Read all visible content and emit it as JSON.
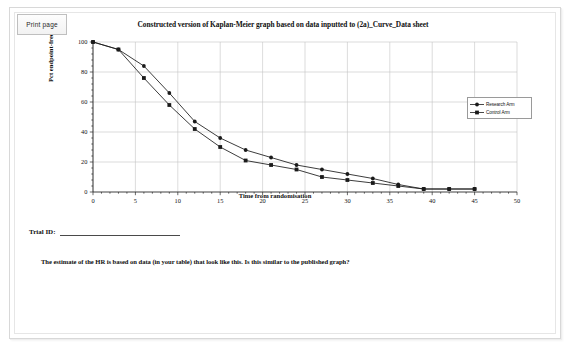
{
  "toolbar": {
    "print_page_label": "Print page"
  },
  "chart": {
    "title": "Constructed version of Kaplan-Meier graph based on data inputted to (2a)_Curve_Data sheet",
    "legend": {
      "position": "right",
      "entries": [
        {
          "label": "Research Arm",
          "color": "#1a1a1a",
          "marker": "square"
        },
        {
          "label": "Control Arm",
          "color": "#1a1a1a",
          "marker": "square"
        }
      ]
    }
  },
  "form": {
    "trial_id_label": "Trial ID:",
    "trial_id_value": ""
  },
  "instructions": {
    "hr_question": "The estimate of the HR is based on data (in your table) that look like this.  Is this similar to the published graph?"
  },
  "chart_data": {
    "type": "line",
    "title": "Constructed version of Kaplan-Meier graph based on data inputted to (2a)_Curve_Data sheet",
    "xlabel": "Time from randomisation",
    "ylabel": "Pct endpoint-free",
    "xlim": [
      0,
      50
    ],
    "ylim": [
      0,
      100
    ],
    "xticks": [
      0,
      5,
      10,
      15,
      20,
      25,
      30,
      35,
      40,
      45,
      50
    ],
    "yticks": [
      0,
      20,
      40,
      60,
      80,
      100
    ],
    "grid": true,
    "x": [
      0,
      3,
      6,
      9,
      12,
      15,
      18,
      21,
      24,
      27,
      30,
      33,
      36,
      39,
      42,
      45
    ],
    "series": [
      {
        "name": "Research Arm",
        "color": "#1a1a1a",
        "marker": "circle",
        "values": [
          100,
          95,
          84,
          66,
          47,
          36,
          28,
          23,
          18,
          15,
          12,
          9,
          5,
          2,
          2,
          2
        ]
      },
      {
        "name": "Control Arm",
        "color": "#1a1a1a",
        "marker": "square",
        "values": [
          100,
          95,
          76,
          58,
          42,
          30,
          21,
          18,
          15,
          10,
          8,
          6,
          4,
          2,
          2,
          2
        ]
      }
    ]
  }
}
